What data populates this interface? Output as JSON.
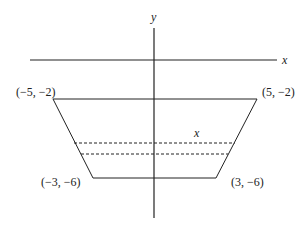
{
  "diagram": {
    "axes": {
      "x_label": "x",
      "y_label": "y"
    },
    "vertices": [
      {
        "label": "(−5, −2)",
        "x": -5,
        "y": -2
      },
      {
        "label": "(5, −2)",
        "x": 5,
        "y": -2
      },
      {
        "label": "(−3, −6)",
        "x": -3,
        "y": -6
      },
      {
        "label": "(3, −6)",
        "x": 3,
        "y": -6
      }
    ],
    "strip_label": "x",
    "colors": {
      "line": "#222222",
      "background": "#ffffff"
    }
  }
}
